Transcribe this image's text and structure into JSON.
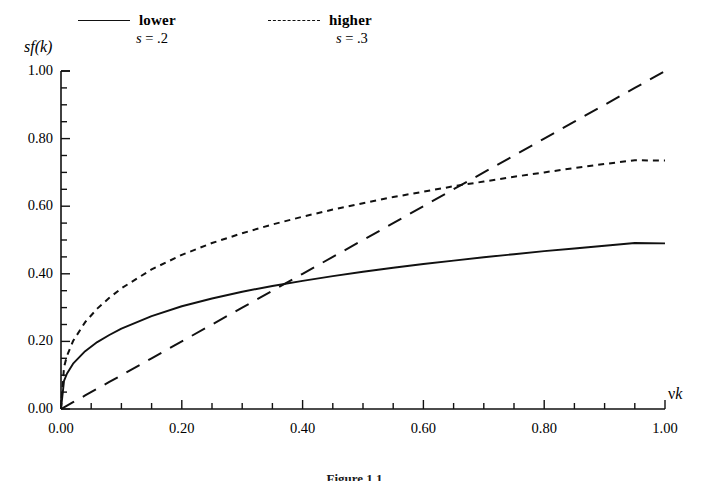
{
  "figure": {
    "caption": "Figure 1.1"
  },
  "legend": {
    "position": "top",
    "entries": [
      {
        "label": "lower",
        "sublabel_var": "s",
        "sublabel_eq": " = .2",
        "style": "solid",
        "name": "legend-lower"
      },
      {
        "label": "higher",
        "sublabel_var": "s",
        "sublabel_eq": " = .3",
        "style": "dashed",
        "name": "legend-higher"
      }
    ]
  },
  "axes": {
    "ylabel_prefix": "s",
    "ylabel_body": "f(k)",
    "ylabel_full": "sf(k)",
    "xlabel_nu": "ν",
    "xlabel_k": "k",
    "xlabel_full": "νk",
    "xlim": [
      0,
      1
    ],
    "ylim": [
      0,
      1
    ],
    "xticks": [
      "0.00",
      "0.20",
      "0.40",
      "0.60",
      "0.80",
      "1.00"
    ],
    "yticks": [
      "0.00",
      "0.20",
      "0.40",
      "0.60",
      "0.80",
      "1.00"
    ],
    "xtick_values": [
      0,
      0.2,
      0.4,
      0.6,
      0.8,
      1.0
    ],
    "ytick_values": [
      0,
      0.2,
      0.4,
      0.6,
      0.8,
      1.0
    ],
    "minor_tick_step": 0.05,
    "grid": false
  },
  "chart_data": {
    "type": "line",
    "title": "",
    "subtitle": "",
    "xlabel": "νk",
    "ylabel": "sf(k)",
    "xlim": [
      0,
      1
    ],
    "ylim": [
      0,
      1
    ],
    "grid": false,
    "legend_position": "top",
    "annotations": [
      {
        "text": "crossing of sf(k) s=.2 with νk",
        "x": 0.35,
        "y": 0.355
      },
      {
        "text": "crossing of sf(k) s=.3 with νk",
        "x": 0.65,
        "y": 0.655
      }
    ],
    "x": [
      0.0,
      0.005,
      0.01,
      0.02,
      0.04,
      0.06,
      0.08,
      0.1,
      0.15,
      0.2,
      0.25,
      0.3,
      0.35,
      0.4,
      0.45,
      0.5,
      0.55,
      0.6,
      0.65,
      0.7,
      0.75,
      0.8,
      0.85,
      0.9,
      0.95,
      1.0
    ],
    "series": [
      {
        "name": "lower",
        "label": "lower  s = .2",
        "style": "solid",
        "s": 0.2,
        "values": [
          0.0,
          0.0325,
          0.0415,
          0.0529,
          0.0675,
          0.0781,
          0.0866,
          0.0939,
          0.1087,
          0.1199,
          0.1291,
          0.1368,
          0.1437,
          0.1497,
          0.1552,
          0.1603,
          0.1649,
          0.1693,
          0.1733,
          0.1772,
          0.1808,
          0.1843,
          0.1876,
          0.1908,
          0.1938,
          0.1967
        ]
      },
      {
        "name": "higher",
        "label": "higher  s = .3",
        "style": "short-dashed",
        "s": 0.3,
        "values": [
          0.0,
          0.0487,
          0.0622,
          0.0794,
          0.1013,
          0.1172,
          0.1299,
          0.1408,
          0.1631,
          0.1799,
          0.1936,
          0.2053,
          0.2155,
          0.2246,
          0.2328,
          0.2404,
          0.2474,
          0.2539,
          0.26,
          0.2658,
          0.2712,
          0.2764,
          0.2814,
          0.2862,
          0.2907,
          0.2951
        ]
      },
      {
        "name": "depreciation",
        "label": "νk",
        "style": "long-dashed",
        "values": [
          0.0,
          0.005,
          0.01,
          0.02,
          0.04,
          0.06,
          0.08,
          0.1,
          0.15,
          0.2,
          0.25,
          0.3,
          0.35,
          0.4,
          0.45,
          0.5,
          0.55,
          0.6,
          0.65,
          0.7,
          0.75,
          0.8,
          0.85,
          0.9,
          0.95,
          1.0
        ]
      }
    ],
    "series_display": [
      {
        "name": "lower-display",
        "style": "solid",
        "values": [
          0.0,
          0.083,
          0.105,
          0.134,
          0.171,
          0.198,
          0.219,
          0.238,
          0.275,
          0.304,
          0.327,
          0.347,
          0.364,
          0.379,
          0.393,
          0.406,
          0.418,
          0.429,
          0.439,
          0.449,
          0.458,
          0.467,
          0.475,
          0.483,
          0.491,
          0.49
        ]
      },
      {
        "name": "higher-display",
        "style": "short-dashed",
        "values": [
          0.0,
          0.124,
          0.158,
          0.201,
          0.257,
          0.297,
          0.329,
          0.357,
          0.413,
          0.456,
          0.491,
          0.52,
          0.546,
          0.569,
          0.59,
          0.609,
          0.627,
          0.643,
          0.659,
          0.673,
          0.687,
          0.7,
          0.713,
          0.725,
          0.736,
          0.735
        ]
      }
    ]
  },
  "colors": {
    "ink": "#111111",
    "background": "#ffffff"
  }
}
